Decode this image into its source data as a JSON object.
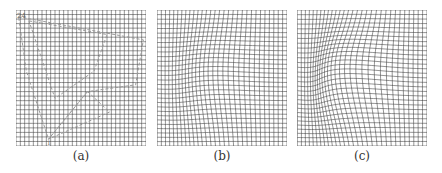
{
  "figure": {
    "panels": [
      {
        "id": "a",
        "label": "(a)",
        "left": 16,
        "deformation": "none",
        "overlay_markers": true
      },
      {
        "id": "b",
        "label": "(b)",
        "left": 157,
        "deformation": "moderate"
      },
      {
        "id": "c",
        "label": "(c)",
        "left": 297,
        "deformation": "strong"
      }
    ],
    "grid": {
      "cells": 30,
      "line_color": "#3a3a3a",
      "line_width": 0.55
    },
    "overlay": {
      "color": "#9a9a9a",
      "dash": "3,2",
      "polygons": [
        [
          [
            0.02,
            0.05
          ],
          [
            0.98,
            0.22
          ],
          [
            0.92,
            0.55
          ],
          [
            0.55,
            0.6
          ],
          [
            0.25,
            0.95
          ],
          [
            0.08,
            0.45
          ]
        ],
        [
          [
            0.1,
            0.08
          ],
          [
            0.7,
            0.18
          ],
          [
            0.6,
            0.45
          ],
          [
            0.3,
            0.65
          ]
        ],
        [
          [
            0.55,
            0.6
          ],
          [
            0.72,
            0.75
          ],
          [
            0.25,
            0.95
          ]
        ]
      ],
      "corner_label": "24",
      "bottom_label": "1"
    }
  }
}
